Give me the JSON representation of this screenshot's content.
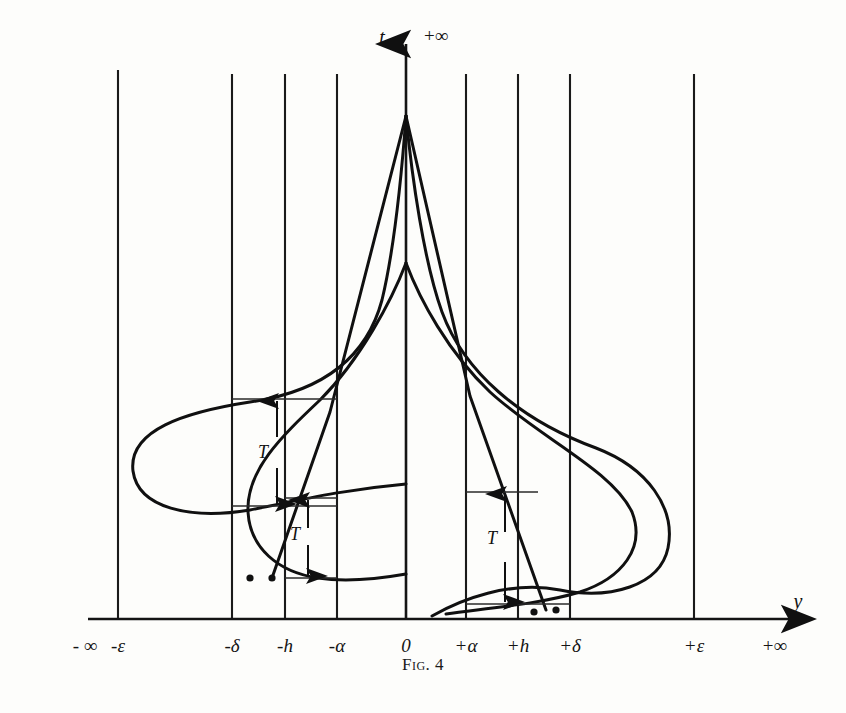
{
  "figure": {
    "caption": "Fig. 4",
    "background_color": "#fdfdfb",
    "ink_color": "#101010"
  },
  "axes": {
    "vertical": {
      "name": "t-axis",
      "label": "t",
      "top_label": "+∞",
      "x_px": 406,
      "arrow": "up"
    },
    "horizontal": {
      "name": "y-axis",
      "label": "y",
      "baseline_y_px": 619,
      "arrow": "right",
      "left_label": "- ∞",
      "right_label": "+∞"
    }
  },
  "ticks": [
    {
      "label": "- ∞",
      "x_px": 85,
      "gridline": false
    },
    {
      "label": "-ε",
      "x_px": 118,
      "gridline": true
    },
    {
      "label": "-δ",
      "x_px": 232,
      "gridline": true
    },
    {
      "label": "-h",
      "x_px": 285,
      "gridline": true
    },
    {
      "label": "-α",
      "x_px": 337,
      "gridline": true
    },
    {
      "label": "0",
      "x_px": 406,
      "gridline": true
    },
    {
      "label": "+α",
      "x_px": 466,
      "gridline": true
    },
    {
      "label": "+h",
      "x_px": 518,
      "gridline": true
    },
    {
      "label": "+δ",
      "x_px": 570,
      "gridline": true
    },
    {
      "label": "+ε",
      "x_px": 694,
      "gridline": true
    },
    {
      "label": "+∞",
      "x_px": 775,
      "gridline": false
    }
  ],
  "annotations": [
    {
      "name": "interval-T-upper-left",
      "label": "T",
      "label_x_px": 263,
      "label_y_px": 452,
      "arrow_x_px": 277,
      "top_y_px": 399,
      "bottom_y_px": 506,
      "bracket_left_px": 232,
      "bracket_right_px": 337
    },
    {
      "name": "interval-T-lower-left",
      "label": "T",
      "label_x_px": 297,
      "label_y_px": 536,
      "arrow_x_px": 308,
      "top_y_px": 498,
      "bottom_y_px": 578,
      "bracket_left_px": 285,
      "bracket_right_px": 337
    },
    {
      "name": "interval-T-right",
      "label": "T",
      "label_x_px": 492,
      "label_y_px": 528,
      "arrow_x_px": 505,
      "top_y_px": 492,
      "bottom_y_px": 604,
      "bracket_left_px": 466,
      "bracket_right_px": 570
    }
  ],
  "chart_data": {
    "type": "line",
    "title": "Fig. 4",
    "xlabel": "y",
    "ylabel": "t",
    "grid": true,
    "legend": "none",
    "x_tick_labels": [
      "- ∞",
      "-ε",
      "-δ",
      "-h",
      "-α",
      "0",
      "+α",
      "+h",
      "+δ",
      "+ε",
      "+∞"
    ],
    "x_tick_px": [
      85,
      118,
      232,
      285,
      337,
      406,
      466,
      518,
      570,
      694,
      775
    ],
    "y_axis_range_labels": [
      "0",
      "+∞"
    ],
    "series": [
      {
        "name": "left-outer-branch",
        "path_px": "M 406,116 C 402,170 394,250 382,300 C 366,360 320,392 250,402 C 185,412 128,430 133,471 C 138,508 190,520 250,510 C 300,500 340,490 406,484"
      },
      {
        "name": "left-inner-branch",
        "path_px": "M 406,263 C 392,300 360,360 320,400 C 282,436 246,470 248,512 C 250,548 278,572 318,578 C 344,582 372,580 406,574"
      },
      {
        "name": "left-secant-line",
        "path_px": "M 406,116 L 330,412 L 272,578"
      },
      {
        "name": "right-outer-branch",
        "path_px": "M 406,116 C 412,178 424,262 442,312 C 464,372 520,420 596,448 C 648,468 676,508 668,548 C 660,586 610,600 560,590 C 510,580 460,600 432,616"
      },
      {
        "name": "right-inner-branch",
        "path_px": "M 406,263 C 420,300 448,352 490,392 C 540,438 612,470 632,512 C 646,548 622,578 580,592 C 540,604 490,608 446,614"
      },
      {
        "name": "right-secant-line",
        "path_px": "M 406,116 L 470,396 L 546,610"
      }
    ],
    "marked_points_px": [
      {
        "name": "left-lower-endpoint-a",
        "x": 250,
        "y": 578
      },
      {
        "name": "left-lower-endpoint-b",
        "x": 272,
        "y": 578
      },
      {
        "name": "right-lower-endpoint-a",
        "x": 534,
        "y": 612
      },
      {
        "name": "right-lower-endpoint-b",
        "x": 556,
        "y": 610
      }
    ]
  }
}
